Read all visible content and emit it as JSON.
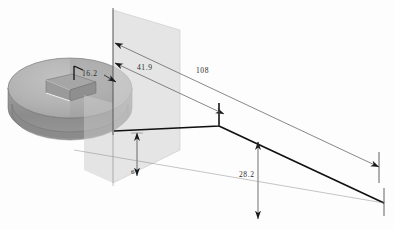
{
  "drawing": {
    "title": "Isometric dimensioned part view",
    "background_color": "#fdfdfd",
    "part": {
      "name": "cylindrical disc with rectangular notch",
      "top_face_color": "#b4b4b4",
      "side_wall_color": "#8e8e8e",
      "shadow_color": "#9a9a9a",
      "notch_color": "#a0a0a0",
      "edge_color": "#6f6f6f"
    },
    "section_plane": {
      "name": "translucent section plane",
      "color": "#d6d6d6",
      "opacity": "0.62"
    },
    "line_colors": {
      "thin_dimension": "#55555a",
      "thick_profile": "#111111",
      "extension": "#7a7a7a",
      "reference_vertical": "#3a3a3a"
    }
  },
  "dimensions": [
    {
      "id": "d1",
      "value": "16.2",
      "kind": "leader",
      "target": "notch depth"
    },
    {
      "id": "d2",
      "value": "41.9",
      "kind": "linear",
      "target": "upper offset"
    },
    {
      "id": "d3",
      "value": "108",
      "kind": "linear",
      "target": "overall length"
    },
    {
      "id": "d4",
      "value": "6",
      "kind": "linear",
      "target": "small vertical gap"
    },
    {
      "id": "d5",
      "value": "28.2",
      "kind": "linear",
      "target": "lower vertical drop"
    }
  ]
}
